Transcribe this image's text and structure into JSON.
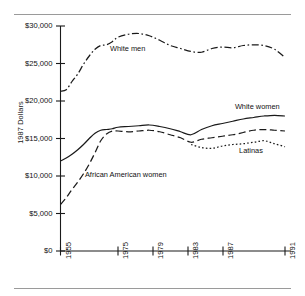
{
  "chart_data": {
    "type": "line",
    "title": "",
    "xlabel": "",
    "ylabel": "1987 Dollars",
    "ylim": [
      0,
      30000
    ],
    "xlim": [
      1955,
      1991
    ],
    "grid": false,
    "legend_position": "inline-annotations",
    "ytick_labels": [
      "$30,000",
      "$25,000",
      "$20,000",
      "$15,000",
      "$10,000",
      "$5,000",
      "$0"
    ],
    "ytick_values": [
      30000,
      25000,
      20000,
      15000,
      10000,
      5000,
      0
    ],
    "xtick_labels": [
      "1955",
      "1975",
      "1979",
      "1983",
      "1987",
      "1991"
    ],
    "xtick_values": [
      1955,
      1975,
      1979,
      1983,
      1987,
      1991
    ],
    "series": [
      {
        "name": "White men",
        "style": "dash-dot",
        "label_x": 1972.2,
        "label_y": 26900,
        "x": [
          1955,
          1957,
          1959,
          1961,
          1963,
          1965,
          1967,
          1969,
          1971,
          1973,
          1975,
          1976,
          1977,
          1978,
          1979,
          1980,
          1981,
          1982,
          1983,
          1984,
          1985,
          1986,
          1987,
          1988,
          1989,
          1990,
          1991
        ],
        "values": [
          21300,
          21500,
          22600,
          23600,
          24900,
          26000,
          26900,
          27400,
          27500,
          27900,
          28500,
          28900,
          29000,
          28700,
          28100,
          27400,
          27000,
          26600,
          26500,
          27000,
          27200,
          27100,
          27400,
          27500,
          27400,
          26900,
          25800
        ]
      },
      {
        "name": "White women",
        "style": "solid",
        "label_x": 1986.2,
        "label_y": 19250,
        "x": [
          1955,
          1957,
          1959,
          1961,
          1963,
          1965,
          1967,
          1969,
          1971,
          1973,
          1975,
          1976,
          1977,
          1978,
          1979,
          1980,
          1981,
          1982,
          1983,
          1984,
          1985,
          1986,
          1987,
          1988,
          1989,
          1990,
          1991
        ],
        "values": [
          12000,
          12400,
          12900,
          13500,
          14200,
          15000,
          15700,
          16100,
          16200,
          16300,
          16500,
          16600,
          16700,
          16800,
          16600,
          16300,
          15900,
          15500,
          16200,
          16700,
          17000,
          17300,
          17600,
          17800,
          18000,
          18100,
          18000
        ]
      },
      {
        "name": "African American women",
        "style": "dashed",
        "label_x": 1963.5,
        "label_y": 10200,
        "x": [
          1955,
          1957,
          1959,
          1961,
          1963,
          1965,
          1967,
          1969,
          1971,
          1973,
          1975,
          1976,
          1977,
          1978,
          1979,
          1980,
          1981,
          1982,
          1983,
          1984,
          1985,
          1986,
          1987,
          1988,
          1989,
          1990,
          1991
        ],
        "values": [
          6200,
          7100,
          8200,
          9200,
          10300,
          11600,
          13100,
          14700,
          15600,
          16000,
          16000,
          15900,
          16000,
          16100,
          15900,
          15500,
          15100,
          14500,
          14900,
          15100,
          15300,
          15500,
          15800,
          16100,
          16200,
          16100,
          16000
        ]
      },
      {
        "name": "Latinas",
        "style": "dotted",
        "label_x": 1986.6,
        "label_y": 13400,
        "x": [
          1982,
          1983,
          1984,
          1985,
          1986,
          1987,
          1988,
          1989,
          1990,
          1991
        ],
        "values": [
          14200,
          13800,
          13700,
          14000,
          14200,
          14300,
          14500,
          14700,
          14300,
          13900
        ]
      }
    ]
  }
}
